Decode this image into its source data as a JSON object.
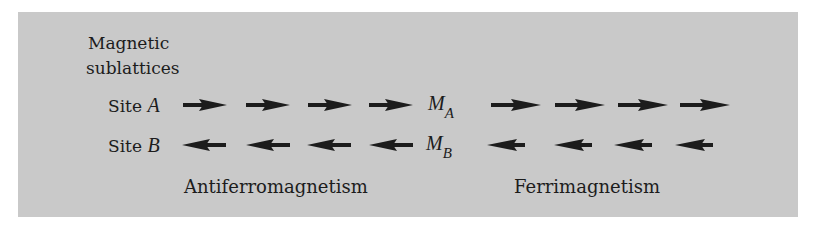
{
  "diagram": {
    "title_line1": "Magnetic",
    "title_line2": "sublattices",
    "rows": {
      "site_a": {
        "label": "Site ",
        "symbol": "A"
      },
      "site_b": {
        "label": "Site ",
        "symbol": "B"
      }
    },
    "magnetization": {
      "m_a": {
        "symbol": "M",
        "subscript": "A"
      },
      "m_b": {
        "symbol": "M",
        "subscript": "B"
      }
    },
    "captions": {
      "antiferro": "Antiferromagnetism",
      "ferri": "Ferrimagnetism"
    },
    "arrows": {
      "antiferro_site_a": {
        "direction": "right",
        "count": 4,
        "length": "equal"
      },
      "antiferro_site_b": {
        "direction": "left",
        "count": 4,
        "length": "equal"
      },
      "ferri_site_a": {
        "direction": "right",
        "count": 4,
        "length": "longer"
      },
      "ferri_site_b": {
        "direction": "left",
        "count": 4,
        "length": "shorter"
      }
    },
    "colors": {
      "panel": "#c9c9c9",
      "ink": "#1c1c1c"
    }
  }
}
